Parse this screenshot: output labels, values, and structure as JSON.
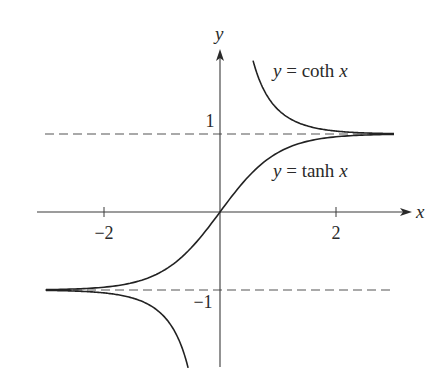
{
  "chart_data": {
    "type": "line",
    "title": "",
    "xlabel": "x",
    "ylabel": "y",
    "xlim": [
      -3.0,
      3.0
    ],
    "ylim": [
      -2.0,
      2.1
    ],
    "grid": false,
    "x_ticks": [
      {
        "value": -2,
        "label": "−2"
      },
      {
        "value": 2,
        "label": "2"
      }
    ],
    "y_ticks": [
      {
        "value": 1,
        "label": "1"
      },
      {
        "value": -1,
        "label": "−1"
      }
    ],
    "asymptotes": [
      {
        "y": 1,
        "style": "dashed"
      },
      {
        "y": -1,
        "style": "dashed"
      }
    ],
    "series": [
      {
        "name": "y = tanh x",
        "function": "tanh",
        "x": [
          -3.0,
          -2.5,
          -2.0,
          -1.5,
          -1.0,
          -0.5,
          0.0,
          0.5,
          1.0,
          1.5,
          2.0,
          2.5,
          3.0
        ],
        "values": [
          -0.995,
          -0.987,
          -0.964,
          -0.905,
          -0.762,
          -0.462,
          0.0,
          0.462,
          0.762,
          0.905,
          0.964,
          0.987,
          0.995
        ]
      },
      {
        "name": "y = coth x (x > 0)",
        "function": "coth",
        "x": [
          0.57,
          0.7,
          0.85,
          1.0,
          1.25,
          1.5,
          2.0,
          2.5,
          3.0
        ],
        "values": [
          1.94,
          1.65,
          1.45,
          1.313,
          1.18,
          1.105,
          1.037,
          1.013,
          1.005
        ]
      },
      {
        "name": "y = coth x (x < 0)",
        "function": "coth",
        "x": [
          -3.0,
          -2.5,
          -2.0,
          -1.5,
          -1.25,
          -1.0,
          -0.85,
          -0.7,
          -0.55
        ],
        "values": [
          -1.005,
          -1.013,
          -1.037,
          -1.105,
          -1.18,
          -1.313,
          -1.45,
          -1.65,
          -1.99
        ]
      }
    ],
    "annotations": [
      {
        "text_prefix": "y",
        "text_mid": " = coth ",
        "text_suffix": "x",
        "near": "upper right curve"
      },
      {
        "text_prefix": "y",
        "text_mid": " = tanh ",
        "text_suffix": "x",
        "near": "tanh curve, right of y-axis"
      }
    ],
    "legend": "none (inline labels)"
  }
}
